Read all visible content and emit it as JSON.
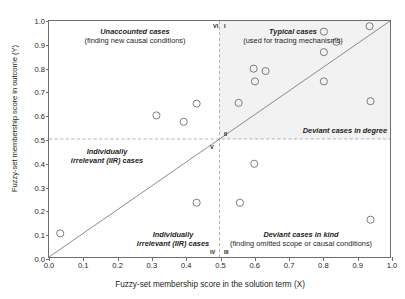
{
  "chart_data": {
    "type": "scatter",
    "title": "",
    "xlabel": "Fuzzy-set membership score in the solution term (X)",
    "ylabel": "Fuzzy-set membership score in outcome (Y)",
    "xlim": [
      0.0,
      1.0
    ],
    "ylim": [
      0.0,
      1.0
    ],
    "xticks": [
      "0.0",
      "0.1",
      "0.2",
      "0.3",
      "0.4",
      "0.5",
      "0.6",
      "0.7",
      "0.8",
      "0.9",
      "1.0"
    ],
    "yticks": [
      "0.0",
      "0.1",
      "0.2",
      "0.3",
      "0.4",
      "0.5",
      "0.6",
      "0.7",
      "0.8",
      "0.9",
      "1.0"
    ],
    "grid": false,
    "legend": "none",
    "points": [
      {
        "x": 0.033,
        "y": 0.1
      },
      {
        "x": 0.315,
        "y": 0.6
      },
      {
        "x": 0.395,
        "y": 0.573
      },
      {
        "x": 0.433,
        "y": 0.65
      },
      {
        "x": 0.433,
        "y": 0.23
      },
      {
        "x": 0.556,
        "y": 0.653
      },
      {
        "x": 0.56,
        "y": 0.23
      },
      {
        "x": 0.6,
        "y": 0.798
      },
      {
        "x": 0.604,
        "y": 0.744
      },
      {
        "x": 0.602,
        "y": 0.395
      },
      {
        "x": 0.635,
        "y": 0.788
      },
      {
        "x": 0.806,
        "y": 0.955
      },
      {
        "x": 0.806,
        "y": 0.868
      },
      {
        "x": 0.806,
        "y": 0.744
      },
      {
        "x": 0.843,
        "y": 0.912
      },
      {
        "x": 0.94,
        "y": 0.978
      },
      {
        "x": 0.943,
        "y": 0.66
      },
      {
        "x": 0.943,
        "y": 0.158
      }
    ],
    "reference_lines": [
      {
        "name": "diagonal",
        "type": "x=y",
        "style": "solid"
      },
      {
        "name": "y-threshold",
        "type": "horizontal",
        "value": 0.5,
        "style": "dashed"
      },
      {
        "name": "x-threshold",
        "type": "vertical",
        "value": 0.5,
        "style": "dashed"
      }
    ],
    "shaded_region": {
      "name": "typical-cases-region",
      "x": [
        0.5,
        1.0
      ],
      "y": [
        0.5,
        1.0
      ],
      "color": "#f2f2f2"
    },
    "annotations": [
      {
        "name": "unaccounted-cases",
        "line1": "Unaccounted cases",
        "line2": "(finding new causal conditions)"
      },
      {
        "name": "typical-cases",
        "line1": "Typical cases",
        "line2": "(used for tracing mechanisms)"
      },
      {
        "name": "deviant-cases-in-degree",
        "line1": "Deviant cases in degree",
        "line2": ""
      },
      {
        "name": "deviant-cases-in-kind",
        "line1": "Deviant cases in kind",
        "line2": "(finding omitted scope or causal conditions)"
      },
      {
        "name": "iir-upper-left",
        "line1": "Individually",
        "line2": "irrelevant (IIR) cases"
      },
      {
        "name": "iir-lower-middle",
        "line1": "Individually",
        "line2": "irrelevant (IIR) cases"
      }
    ],
    "numerals": [
      {
        "name": "numeral-VI",
        "label": "VI"
      },
      {
        "name": "numeral-I",
        "label": "I"
      },
      {
        "name": "numeral-V",
        "label": "V"
      },
      {
        "name": "numeral-II",
        "label": "II"
      },
      {
        "name": "numeral-IV",
        "label": "IV"
      },
      {
        "name": "numeral-III",
        "label": "III"
      }
    ],
    "colors": {
      "marker_stroke": "#6d6e71",
      "axis": "#6d6e71",
      "text": "#231f20",
      "shade": "#f2f2f2",
      "dashed": "#a7a9ac"
    }
  }
}
